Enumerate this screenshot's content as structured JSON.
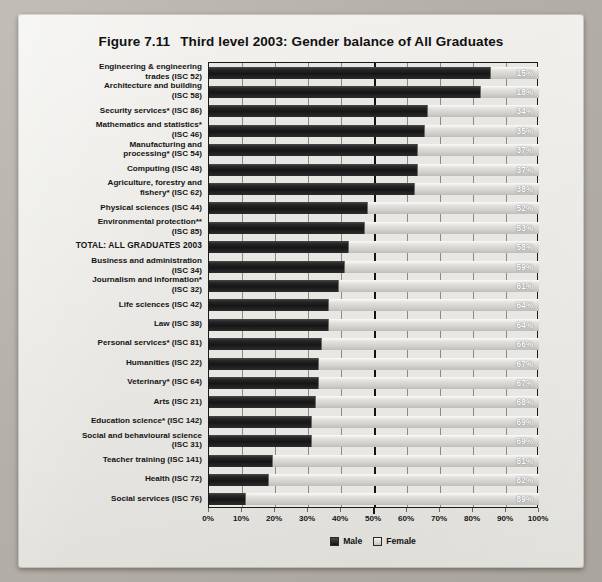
{
  "figure": {
    "number": "Figure 7.11",
    "title": "Third level 2003: Gender balance of All Graduates"
  },
  "legend": {
    "male_label": "Male",
    "female_label": "Female"
  },
  "colors": {
    "male": "#1a1a1a",
    "female": "#d8d6d1",
    "paper": "#eceae6",
    "axis": "#141414",
    "label_text": "#ffffff"
  },
  "chart_data": {
    "type": "bar",
    "orientation": "horizontal",
    "stacked": true,
    "title": "Third level 2003: Gender balance of All Graduates",
    "xlabel": "",
    "ylabel": "",
    "xlim": [
      0,
      100
    ],
    "grid": true,
    "legend_position": "bottom",
    "xticks": [
      "0%",
      "10%",
      "20%",
      "30%",
      "40%",
      "50%",
      "60%",
      "70%",
      "80%",
      "90%",
      "100%"
    ],
    "xtick_values": [
      0,
      10,
      20,
      30,
      40,
      50,
      60,
      70,
      80,
      90,
      100
    ],
    "data_label_series": "Female",
    "categories": [
      "Engineering & engineering trades (ISC 52)",
      "Architecture and building (ISC 58)",
      "Security services* (ISC 86)",
      "Mathematics and statistics* (ISC 46)",
      "Manufacturing and processing* (ISC 54)",
      "Computing (ISC 48)",
      "Agriculture, forestry and fishery* (ISC 62)",
      "Physical sciences (ISC 44)",
      "Environmental protection** (ISC 85)",
      "TOTAL: ALL GRADUATES 2003",
      "Business and administration (ISC 34)",
      "Journalism and information* (ISC 32)",
      "Life sciences (ISC 42)",
      "Law (ISC 38)",
      "Personal services* (ISC 81)",
      "Humanities (ISC 22)",
      "Veterinary* (ISC 64)",
      "Arts (ISC 21)",
      "Education science* (ISC 142)",
      "Social and behavioural science (ISC 31)",
      "Teacher training (ISC 141)",
      "Health (ISC 72)",
      "Social services (ISC 76)"
    ],
    "series": [
      {
        "name": "Male",
        "values": [
          85,
          82,
          66,
          65,
          63,
          63,
          62,
          48,
          47,
          42,
          41,
          39,
          36,
          36,
          34,
          33,
          33,
          32,
          31,
          31,
          19,
          18,
          11
        ]
      },
      {
        "name": "Female",
        "values": [
          15,
          18,
          34,
          35,
          37,
          37,
          38,
          52,
          53,
          58,
          59,
          61,
          64,
          64,
          66,
          67,
          67,
          68,
          69,
          69,
          81,
          82,
          89
        ]
      }
    ],
    "female_labels": [
      "15%",
      "18%",
      "34%",
      "35%",
      "37%",
      "37%",
      "38%",
      "52%",
      "53%",
      "58%",
      "59%",
      "61%",
      "64%",
      "64%",
      "66%",
      "67%",
      "67%",
      "68%",
      "69%",
      "69%",
      "81%",
      "82%",
      "89%"
    ]
  },
  "rows": [
    {
      "label_lines": [
        "Engineering & engineering",
        "trades (ISC 52)"
      ],
      "male": 85,
      "female": 15,
      "female_label": "15%",
      "total": false
    },
    {
      "label_lines": [
        "Architecture and building",
        "(ISC 58)"
      ],
      "male": 82,
      "female": 18,
      "female_label": "18%",
      "total": false
    },
    {
      "label_lines": [
        "Security services* (ISC 86)"
      ],
      "male": 66,
      "female": 34,
      "female_label": "34%",
      "total": false
    },
    {
      "label_lines": [
        "Mathematics and statistics*",
        "(ISC 46)"
      ],
      "male": 65,
      "female": 35,
      "female_label": "35%",
      "total": false
    },
    {
      "label_lines": [
        "Manufacturing and",
        "processing* (ISC 54)"
      ],
      "male": 63,
      "female": 37,
      "female_label": "37%",
      "total": false
    },
    {
      "label_lines": [
        "Computing (ISC 48)"
      ],
      "male": 63,
      "female": 37,
      "female_label": "37%",
      "total": false
    },
    {
      "label_lines": [
        "Agriculture, forestry and",
        "fishery* (ISC 62)"
      ],
      "male": 62,
      "female": 38,
      "female_label": "38%",
      "total": false
    },
    {
      "label_lines": [
        "Physical sciences (ISC 44)"
      ],
      "male": 48,
      "female": 52,
      "female_label": "52%",
      "total": false
    },
    {
      "label_lines": [
        "Environmental protection**",
        "(ISC 85)"
      ],
      "male": 47,
      "female": 53,
      "female_label": "53%",
      "total": false
    },
    {
      "label_lines": [
        "TOTAL: ALL GRADUATES 2003"
      ],
      "male": 42,
      "female": 58,
      "female_label": "58%",
      "total": true
    },
    {
      "label_lines": [
        "Business and administration",
        "(ISC 34)"
      ],
      "male": 41,
      "female": 59,
      "female_label": "59%",
      "total": false
    },
    {
      "label_lines": [
        "Journalism and information*",
        "(ISC 32)"
      ],
      "male": 39,
      "female": 61,
      "female_label": "61%",
      "total": false
    },
    {
      "label_lines": [
        "Life sciences (ISC 42)"
      ],
      "male": 36,
      "female": 64,
      "female_label": "64%",
      "total": false
    },
    {
      "label_lines": [
        "Law (ISC 38)"
      ],
      "male": 36,
      "female": 64,
      "female_label": "64%",
      "total": false
    },
    {
      "label_lines": [
        "Personal services* (ISC 81)"
      ],
      "male": 34,
      "female": 66,
      "female_label": "66%",
      "total": false
    },
    {
      "label_lines": [
        "Humanities (ISC 22)"
      ],
      "male": 33,
      "female": 67,
      "female_label": "67%",
      "total": false
    },
    {
      "label_lines": [
        "Veterinary* (ISC 64)"
      ],
      "male": 33,
      "female": 67,
      "female_label": "67%",
      "total": false
    },
    {
      "label_lines": [
        "Arts (ISC 21)"
      ],
      "male": 32,
      "female": 68,
      "female_label": "68%",
      "total": false
    },
    {
      "label_lines": [
        "Education science* (ISC 142)"
      ],
      "male": 31,
      "female": 69,
      "female_label": "69%",
      "total": false
    },
    {
      "label_lines": [
        "Social and behavioural science",
        "(ISC 31)"
      ],
      "male": 31,
      "female": 69,
      "female_label": "69%",
      "total": false
    },
    {
      "label_lines": [
        "Teacher training (ISC 141)"
      ],
      "male": 19,
      "female": 81,
      "female_label": "81%",
      "total": false
    },
    {
      "label_lines": [
        "Health (ISC 72)"
      ],
      "male": 18,
      "female": 82,
      "female_label": "82%",
      "total": false
    },
    {
      "label_lines": [
        "Social services (ISC 76)"
      ],
      "male": 11,
      "female": 89,
      "female_label": "89%",
      "total": false
    }
  ]
}
